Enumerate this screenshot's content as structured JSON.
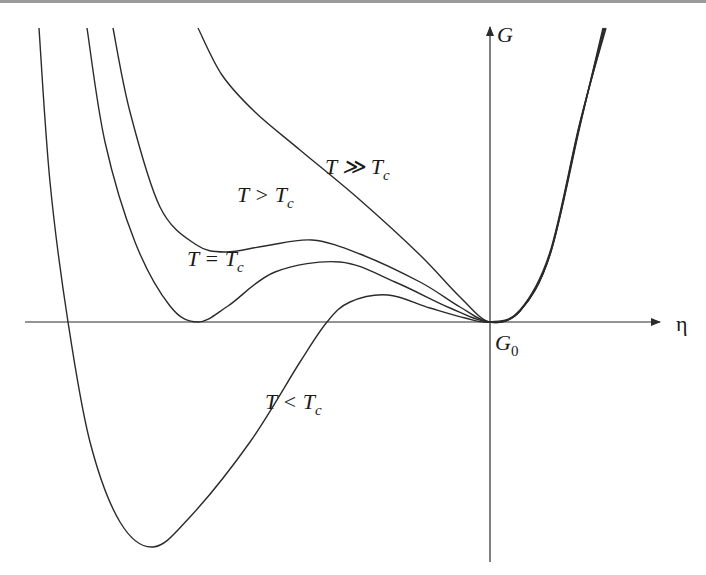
{
  "chart_data": {
    "type": "line",
    "title": "",
    "xlabel": "η",
    "ylabel": "G",
    "origin_label": {
      "main": "G",
      "sub": "0"
    },
    "units_note": "η and G in arbitrary units (1 unit ≈ 100 px scale of original figure); origin at G0",
    "xlim": [
      -4.65,
      1.7
    ],
    "ylim": [
      -2.4,
      2.95
    ],
    "grid": false,
    "legend": "none (curves labeled inline)",
    "series": [
      {
        "name": "T ≫ Tc",
        "label": {
          "main": "T ≫ T",
          "sub": "c"
        },
        "points": [
          [
            -2.92,
            2.94
          ],
          [
            -2.68,
            2.47
          ],
          [
            -2.35,
            2.1
          ],
          [
            -1.9,
            1.72
          ],
          [
            -1.3,
            1.22
          ],
          [
            -0.7,
            0.67
          ],
          [
            -0.3,
            0.25
          ],
          [
            0.0,
            0.0
          ],
          [
            0.3,
            0.12
          ],
          [
            0.6,
            0.7
          ],
          [
            0.9,
            2.0
          ],
          [
            1.16,
            2.94
          ]
        ]
      },
      {
        "name": "T > Tc",
        "label": {
          "main": "T > T",
          "sub": "c"
        },
        "points": [
          [
            -3.77,
            2.94
          ],
          [
            -3.6,
            2.1
          ],
          [
            -3.3,
            1.15
          ],
          [
            -2.95,
            0.78
          ],
          [
            -2.65,
            0.7
          ],
          [
            -2.25,
            0.76
          ],
          [
            -1.78,
            0.82
          ],
          [
            -1.3,
            0.68
          ],
          [
            -0.7,
            0.4
          ],
          [
            -0.3,
            0.15
          ],
          [
            0.0,
            0.0
          ],
          [
            0.3,
            0.11
          ],
          [
            0.6,
            0.68
          ],
          [
            0.9,
            1.98
          ],
          [
            1.15,
            2.94
          ]
        ]
      },
      {
        "name": "T = Tc",
        "label": {
          "main": "T = T",
          "sub": "c"
        },
        "points": [
          [
            -4.03,
            2.94
          ],
          [
            -3.85,
            1.8
          ],
          [
            -3.55,
            0.8
          ],
          [
            -3.2,
            0.16
          ],
          [
            -2.92,
            0.0
          ],
          [
            -2.62,
            0.16
          ],
          [
            -2.15,
            0.5
          ],
          [
            -1.5,
            0.6
          ],
          [
            -0.95,
            0.4
          ],
          [
            -0.4,
            0.14
          ],
          [
            0.0,
            0.0
          ],
          [
            0.3,
            0.11
          ],
          [
            0.6,
            0.68
          ],
          [
            0.9,
            1.98
          ],
          [
            1.14,
            2.94
          ]
        ]
      },
      {
        "name": "T < Tc",
        "label": {
          "main": "T < T",
          "sub": "c"
        },
        "points": [
          [
            -4.51,
            2.94
          ],
          [
            -4.4,
            1.4
          ],
          [
            -4.22,
            0.0
          ],
          [
            -4.0,
            -1.2
          ],
          [
            -3.7,
            -2.0
          ],
          [
            -3.37,
            -2.25
          ],
          [
            -3.0,
            -1.95
          ],
          [
            -2.4,
            -1.2
          ],
          [
            -1.9,
            -0.4
          ],
          [
            -1.63,
            0.0
          ],
          [
            -1.4,
            0.2
          ],
          [
            -1.02,
            0.27
          ],
          [
            -0.6,
            0.14
          ],
          [
            -0.25,
            0.04
          ],
          [
            0.0,
            0.0
          ],
          [
            0.3,
            0.11
          ],
          [
            0.6,
            0.67
          ],
          [
            0.9,
            1.96
          ],
          [
            1.13,
            2.94
          ]
        ]
      }
    ],
    "annotations": [
      {
        "text": "T ≫ Tc",
        "series": "T ≫ Tc"
      },
      {
        "text": "T > Tc",
        "series": "T > Tc"
      },
      {
        "text": "T = Tc",
        "series": "T = Tc"
      },
      {
        "text": "T < Tc",
        "series": "T < Tc"
      },
      {
        "text": "G0",
        "at": "origin"
      }
    ]
  }
}
